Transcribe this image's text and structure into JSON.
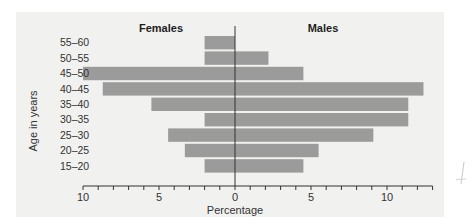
{
  "chart_data": {
    "type": "bar",
    "orientation": "horizontal",
    "subtype": "population-pyramid",
    "title": "",
    "left_title": "Females",
    "right_title": "Males",
    "xlabel": "Percentage",
    "ylabel": "Age in years",
    "categories": [
      "55–60",
      "50–55",
      "45–50",
      "40–45",
      "35–40",
      "30–35",
      "25–30",
      "20–25",
      "15–20"
    ],
    "series": [
      {
        "name": "Females",
        "side": "left",
        "values": [
          2.0,
          2.0,
          10.0,
          8.7,
          5.5,
          2.0,
          4.4,
          3.3,
          2.0
        ]
      },
      {
        "name": "Males",
        "side": "right",
        "values": [
          0.0,
          2.2,
          4.5,
          12.4,
          11.4,
          11.4,
          9.1,
          5.5,
          4.5
        ]
      }
    ],
    "xlim_left": [
      10,
      0
    ],
    "xlim_right": [
      0,
      13
    ],
    "x_tick_labels": [
      {
        "value": -10,
        "label": "10"
      },
      {
        "value": -5,
        "label": "5"
      },
      {
        "value": 0,
        "label": "0"
      },
      {
        "value": 5,
        "label": "5"
      },
      {
        "value": 10,
        "label": "10"
      }
    ],
    "minor_tick_step": 1,
    "grid": false,
    "legend": "none",
    "bar_color": "#9b9b9b",
    "background_color": "#f1f1ef"
  }
}
